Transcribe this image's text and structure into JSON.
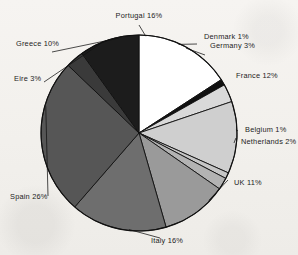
{
  "chart_data": {
    "type": "pie",
    "title": "",
    "subtitle": "",
    "xlabel": "",
    "ylabel": "",
    "legend_position": "none",
    "grid": false,
    "labels_show_percent": true,
    "categories": [
      "Portugal",
      "Denmark",
      "Germany",
      "France",
      "Belgium",
      "Netherlands",
      "UK",
      "Italy",
      "Spain",
      "Eire",
      "Greece"
    ],
    "values": [
      16,
      1,
      3,
      12,
      1,
      2,
      11,
      16,
      26,
      3,
      10
    ],
    "unit": "%",
    "slices": [
      {
        "name": "Portugal",
        "value": 16,
        "label": "Portugal 16%",
        "color": "#ffffff",
        "side": "c"
      },
      {
        "name": "Denmark",
        "value": 1,
        "label": "Denmark 1%",
        "color": "#111111",
        "side": "r"
      },
      {
        "name": "Germany",
        "value": 3,
        "label": "Germany 3%",
        "color": "#d9d9d9",
        "side": "r"
      },
      {
        "name": "France",
        "value": 12,
        "label": "France 12%",
        "color": "#cfcfcf",
        "side": "r"
      },
      {
        "name": "Belgium",
        "value": 1,
        "label": "Belgium 1%",
        "color": "#c6c6c6",
        "side": "r"
      },
      {
        "name": "Netherlands",
        "value": 2,
        "label": "Netherlands 2%",
        "color": "#b3b3b3",
        "side": "r"
      },
      {
        "name": "UK",
        "value": 11,
        "label": "UK 11%",
        "color": "#9a9a9a",
        "side": "r"
      },
      {
        "name": "Italy",
        "value": 16,
        "label": "Italy 16%",
        "color": "#6e6e6e",
        "side": "c"
      },
      {
        "name": "Spain",
        "value": 26,
        "label": "Spain 26%",
        "color": "#565656",
        "side": "l"
      },
      {
        "name": "Eire",
        "value": 3,
        "label": "Eire 3%",
        "color": "#3a3a3a",
        "side": "l"
      },
      {
        "name": "Greece",
        "value": 10,
        "label": "Greece 10%",
        "color": "#1c1c1c",
        "side": "l"
      }
    ],
    "colors": {
      "outline": "#111111",
      "background": "#f4f2ef",
      "text": "#1d1d1d"
    }
  }
}
